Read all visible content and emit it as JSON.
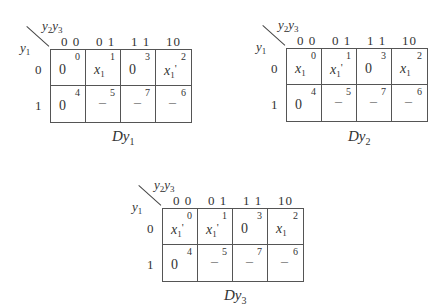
{
  "maps": [
    {
      "name": "Dy1",
      "title_main": "Dy",
      "title_sub": "1",
      "row_var": "y",
      "row_var_sub": "1",
      "col_vars": [
        "y",
        "2",
        "y",
        "3"
      ],
      "col_labels": [
        "0 0",
        "0 1",
        "1 1",
        "10"
      ],
      "row_labels": [
        "0",
        "1"
      ],
      "cells": [
        [
          {
            "m": "0",
            "v": "0"
          },
          {
            "m": "1",
            "v": "x1"
          },
          {
            "m": "3",
            "v": "0"
          },
          {
            "m": "2",
            "v": "x1'"
          }
        ],
        [
          {
            "m": "4",
            "v": "0"
          },
          {
            "m": "5",
            "v": "-"
          },
          {
            "m": "7",
            "v": "-"
          },
          {
            "m": "6",
            "v": "-"
          }
        ]
      ]
    },
    {
      "name": "Dy2",
      "title_main": "Dy",
      "title_sub": "2",
      "row_var": "y",
      "row_var_sub": "1",
      "col_vars": [
        "y",
        "2",
        "y",
        "3"
      ],
      "col_labels": [
        "0 0",
        "0 1",
        "1 1",
        "10"
      ],
      "row_labels": [
        "0",
        "1"
      ],
      "cells": [
        [
          {
            "m": "0",
            "v": "x1"
          },
          {
            "m": "1",
            "v": "x1'"
          },
          {
            "m": "3",
            "v": "0"
          },
          {
            "m": "2",
            "v": "x1"
          }
        ],
        [
          {
            "m": "4",
            "v": "0"
          },
          {
            "m": "5",
            "v": "-"
          },
          {
            "m": "7",
            "v": "-"
          },
          {
            "m": "6",
            "v": "-"
          }
        ]
      ]
    },
    {
      "name": "Dy3",
      "title_main": "Dy",
      "title_sub": "3",
      "row_var": "y",
      "row_var_sub": "1",
      "col_vars": [
        "y",
        "2",
        "y",
        "3"
      ],
      "col_labels": [
        "0 0",
        "0 1",
        "1 1",
        "10"
      ],
      "row_labels": [
        "0",
        "1"
      ],
      "cells": [
        [
          {
            "m": "0",
            "v": "x1'"
          },
          {
            "m": "1",
            "v": "x1'"
          },
          {
            "m": "3",
            "v": "0"
          },
          {
            "m": "2",
            "v": "x1"
          }
        ],
        [
          {
            "m": "4",
            "v": "0"
          },
          {
            "m": "5",
            "v": "-"
          },
          {
            "m": "7",
            "v": "-"
          },
          {
            "m": "6",
            "v": "-"
          }
        ]
      ]
    }
  ]
}
